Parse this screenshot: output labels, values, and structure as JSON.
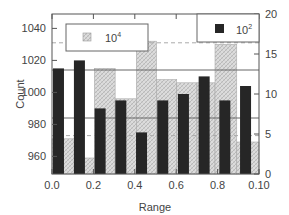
{
  "chart_data": {
    "type": "bar",
    "title": "",
    "xlabel": "Range",
    "ylabel": "Count",
    "y2label": "",
    "x_ticks": [
      "0.0",
      "0.2",
      "0.4",
      "0.6",
      "0.8",
      "0.10"
    ],
    "y_ticks": [
      960,
      980,
      1000,
      1020,
      1040
    ],
    "y2_ticks": [
      0,
      5,
      10,
      15,
      20
    ],
    "ylim": [
      949,
      1049
    ],
    "y2lim": [
      0,
      20
    ],
    "grid": false,
    "legend": [
      {
        "name": "10^4",
        "label": "10",
        "sup": "4",
        "style": "hatched",
        "position": "top-left"
      },
      {
        "name": "10^2",
        "label": "10",
        "sup": "2",
        "style": "dark",
        "position": "top-right"
      }
    ],
    "series": [
      {
        "name": "10^4",
        "style": "hatched-gray",
        "axis": "left",
        "bins": [
          [
            0.0,
            0.045
          ],
          [
            0.045,
            0.082
          ],
          [
            0.082,
            0.122
          ],
          [
            0.122,
            0.163
          ],
          [
            0.163,
            0.202
          ],
          [
            0.202,
            0.241
          ],
          [
            0.241,
            0.28
          ],
          [
            0.28,
            0.315
          ],
          [
            0.315,
            0.357
          ],
          [
            0.357,
            0.4
          ]
        ],
        "values": [
          971,
          959,
          1015,
          996,
          1032,
          1008,
          1006,
          1006,
          1030,
          969
        ]
      },
      {
        "name": "10^2",
        "style": "dark",
        "axis": "left",
        "centers": [
          0.0125,
          0.053,
          0.093,
          0.133,
          0.173,
          0.214,
          0.254,
          0.294,
          0.334,
          0.374
        ],
        "values": [
          1015,
          1020,
          990,
          995,
          975,
          995,
          999,
          1010,
          995,
          1004
        ]
      }
    ],
    "reference_lines": [
      {
        "style": "dashed",
        "value": 1031,
        "color": "#aaaaaa"
      },
      {
        "style": "solid",
        "value": 1014,
        "color": "#666666"
      },
      {
        "style": "solid",
        "value": 984,
        "color": "#666666"
      },
      {
        "style": "dashed",
        "value": 973,
        "color": "#aaaaaa"
      }
    ],
    "colors": {
      "dark": "#262626",
      "hatch_bg": "#d9d9d9",
      "hatch_line": "#a8a8a8",
      "axis": "#555555"
    }
  }
}
